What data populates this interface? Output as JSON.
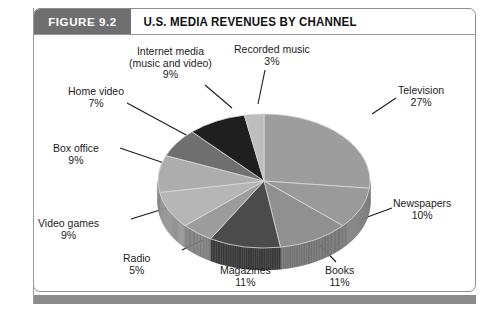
{
  "figure": {
    "tag": "FIGURE 9.2",
    "title": "U.S. MEDIA REVENUES BY CHANNEL"
  },
  "colors": {
    "tag_background": "#6f6f6f",
    "tag_text": "#ffffff",
    "title_text": "#111111",
    "frame_border": "#8d8d8d",
    "footer_bar": "#8b8b8b",
    "label_text": "#1c1c1c",
    "leader_line": "#1a1a1a",
    "page_background": "#ffffff"
  },
  "chart_data": {
    "type": "pie",
    "title": "U.S. MEDIA REVENUES BY CHANNEL",
    "subtitle": "",
    "xlabel": "",
    "ylabel": "",
    "unit": "%",
    "three_d": true,
    "start_angle_deg": 0,
    "direction": "clockwise",
    "legend": "none (direct labels with leader lines)",
    "grid": false,
    "categories": [
      "Television",
      "Newspapers",
      "Books",
      "Magazines",
      "Radio",
      "Video games",
      "Box office",
      "Home video",
      "Internet media (music and video)",
      "Recorded music"
    ],
    "values": [
      27,
      10,
      11,
      11,
      5,
      9,
      9,
      7,
      9,
      3
    ],
    "total": 101,
    "slices": [
      {
        "label": "Television",
        "label_line1": "Television",
        "value": 27,
        "value_text": "27%",
        "fill": "#9d9d9d",
        "side_fill": "#7f7f7f",
        "label_position": "right-top",
        "label_x": 398,
        "label_y": 85,
        "leader": [
          372,
          114,
          396,
          98
        ]
      },
      {
        "label": "Newspapers",
        "label_line1": "Newspapers",
        "value": 10,
        "value_text": "10%",
        "fill": "#9a9a9a",
        "side_fill": "#7d7d7d",
        "label_position": "right-bottom",
        "label_x": 393,
        "label_y": 198,
        "leader": [
          362,
          219,
          392,
          208
        ]
      },
      {
        "label": "Books",
        "label_line1": "Books",
        "value": 11,
        "value_text": "11%",
        "fill": "#909090",
        "side_fill": "#747474",
        "label_position": "bottom-right",
        "label_x": 325,
        "label_y": 265,
        "leader": [
          319,
          244,
          336,
          262
        ]
      },
      {
        "label": "Magazines",
        "label_line1": "Magazines",
        "value": 11,
        "value_text": "11%",
        "fill": "#4b4b4b",
        "side_fill": "#3a3a3a",
        "label_position": "bottom-center",
        "label_x": 220,
        "label_y": 265,
        "leader": [
          251,
          247,
          251,
          262
        ]
      },
      {
        "label": "Radio",
        "label_line1": "Radio",
        "value": 5,
        "value_text": "5%",
        "fill": "#9c9c9c",
        "side_fill": "#7e7e7e",
        "label_position": "bottom-left",
        "label_x": 123,
        "label_y": 253,
        "leader": [
          203,
          240,
          182,
          250
        ]
      },
      {
        "label": "Video games",
        "label_line1": "Video games",
        "value": 9,
        "value_text": "9%",
        "fill": "#b6b6b6",
        "side_fill": "#949494",
        "label_position": "left-bottom",
        "label_x": 38,
        "label_y": 218,
        "leader": [
          170,
          207,
          131,
          219
        ]
      },
      {
        "label": "Box office",
        "label_line1": "Box office",
        "value": 9,
        "value_text": "9%",
        "fill": "#adadad",
        "side_fill": "#8c8c8c",
        "label_position": "left-top",
        "label_x": 53,
        "label_y": 143,
        "leader": [
          164,
          163,
          120,
          148
        ]
      },
      {
        "label": "Home video",
        "label_line1": "Home video",
        "value": 7,
        "value_text": "7%",
        "fill": "#6f6f6f",
        "side_fill": "#5a5a5a",
        "label_position": "left-upper",
        "label_x": 68,
        "label_y": 86,
        "leader": [
          188,
          136,
          127,
          103
        ]
      },
      {
        "label": "Internet media (music and video)",
        "label_line1": "Internet media",
        "label_line2": "(music and video)",
        "value": 9,
        "value_text": "9%",
        "fill": "#1f1f1f",
        "side_fill": "#151515",
        "label_position": "top-center",
        "label_x": 129,
        "label_y": 46,
        "leader": [
          232,
          108,
          205,
          85
        ]
      },
      {
        "label": "Recorded music",
        "label_line1": "Recorded music",
        "value": 3,
        "value_text": "3%",
        "fill": "#bdbdbd",
        "side_fill": "#9a9a9a",
        "label_position": "top-right",
        "label_x": 234,
        "label_y": 44,
        "leader": [
          258,
          104,
          265,
          70
        ]
      }
    ],
    "geometry": {
      "center_x": 264,
      "center_y": 181,
      "radius_x": 106,
      "radius_y": 67,
      "depth": 22
    }
  }
}
